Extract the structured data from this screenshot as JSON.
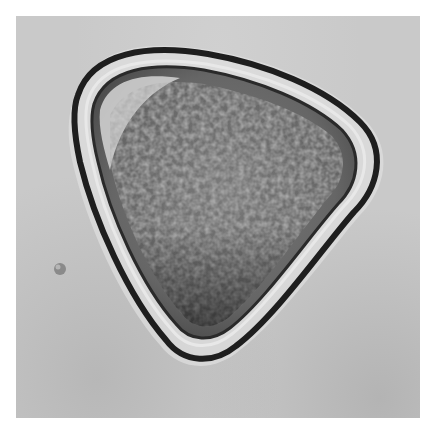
{
  "image": {
    "subject": "pollen grain micrograph",
    "colors": {
      "border": "#ffffff",
      "background_field": "#c9c9c9",
      "wall_dark": "#1e1e1e",
      "interior": "#6e6e6e",
      "halo": "#e2e2e2"
    }
  }
}
